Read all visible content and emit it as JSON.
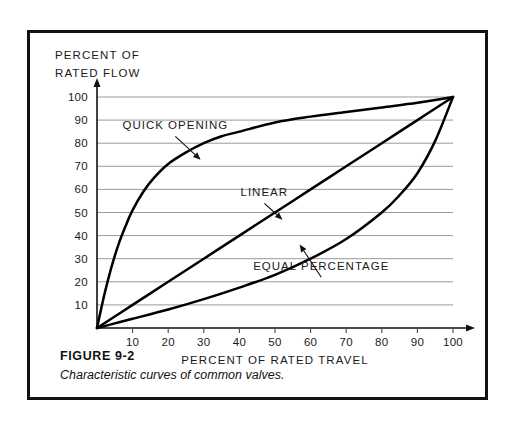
{
  "figure": {
    "caption_title": "FIGURE 9-2",
    "caption_text": "Characteristic curves of common valves.",
    "frame_color": "#111111",
    "background_color": "#ffffff"
  },
  "chart_data": {
    "type": "line",
    "title": "",
    "xlabel": "PERCENT OF RATED TRAVEL",
    "ylabel_line1": "PERCENT OF",
    "ylabel_line2": "RATED FLOW",
    "xlim": [
      0,
      100
    ],
    "ylim": [
      0,
      100
    ],
    "xticks": [
      10,
      20,
      30,
      40,
      50,
      60,
      70,
      80,
      90,
      100
    ],
    "yticks": [
      10,
      20,
      30,
      40,
      50,
      60,
      70,
      80,
      90,
      100
    ],
    "grid": true,
    "grid_axis": "y",
    "legend": "inline-annotations",
    "line_color": "#000000",
    "grid_color": "#8e8e8e",
    "series": [
      {
        "name": "QUICK OPENING",
        "label_x": 22,
        "label_y": 86,
        "pointer_x": 29,
        "pointer_y": 73,
        "x": [
          0,
          2,
          4,
          6,
          8,
          10,
          13,
          16,
          20,
          25,
          30,
          35,
          40,
          50,
          60,
          70,
          80,
          90,
          100
        ],
        "y": [
          0,
          14,
          26,
          36,
          44,
          51,
          59,
          65,
          71,
          76,
          80,
          83,
          85,
          89,
          91.5,
          93.5,
          95.5,
          97.5,
          100
        ]
      },
      {
        "name": "LINEAR",
        "label_x": 47,
        "label_y": 57,
        "pointer_x": 52,
        "pointer_y": 47,
        "x": [
          0,
          10,
          20,
          30,
          40,
          50,
          60,
          70,
          80,
          90,
          100
        ],
        "y": [
          0,
          10,
          20,
          30,
          40,
          50,
          60,
          70,
          80,
          90,
          100
        ]
      },
      {
        "name": "EQUAL PERCENTAGE",
        "label_x": 63,
        "label_y": 25,
        "pointer_x": 57,
        "pointer_y": 36,
        "x": [
          0,
          5,
          10,
          20,
          30,
          40,
          50,
          60,
          70,
          80,
          85,
          90,
          95,
          100
        ],
        "y": [
          0,
          2,
          4,
          8,
          12.5,
          17.5,
          23,
          30,
          38.5,
          50,
          57.5,
          67,
          81,
          100
        ]
      }
    ]
  }
}
